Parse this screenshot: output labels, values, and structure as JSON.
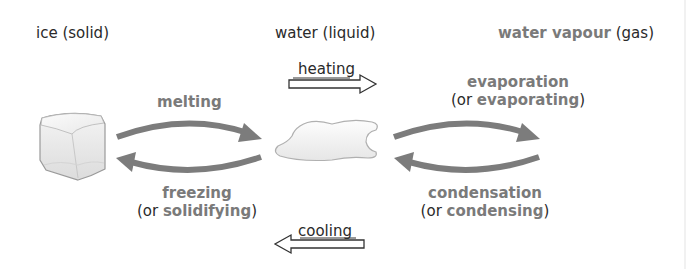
{
  "diagram": {
    "colors": {
      "emphasis": "#7a7a7a",
      "text": "#2a2a2a",
      "arrow": "#7c7c7c",
      "background": "#ffffff"
    },
    "states": [
      {
        "id": "ice",
        "name": "ice",
        "state": "(solid)",
        "icon": "ice-cube-icon"
      },
      {
        "id": "water",
        "name": "water",
        "state": "(liquid)",
        "icon": "water-puddle-icon"
      },
      {
        "id": "vapour",
        "name": "water vapour",
        "state": "(gas)"
      }
    ],
    "processes": {
      "melting": {
        "label": "melting"
      },
      "freezing": {
        "label": "freezing",
        "alt_prefix": "(or ",
        "alt": "solidifying",
        "alt_suffix": ")"
      },
      "evaporation": {
        "label": "evaporation",
        "alt_prefix": "(or ",
        "alt": "evaporating",
        "alt_suffix": ")"
      },
      "condensation": {
        "label": "condensation",
        "alt_prefix": "(or ",
        "alt": "condensing",
        "alt_suffix": ")"
      }
    },
    "direction_arrows": {
      "heating": {
        "label": "heating",
        "direction": "right"
      },
      "cooling": {
        "label": "cooling",
        "direction": "left"
      }
    }
  }
}
